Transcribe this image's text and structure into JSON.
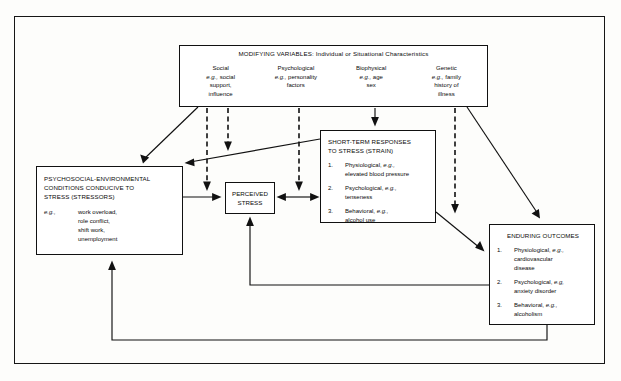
{
  "diagram": {
    "type": "flow-model",
    "modifying": {
      "header": "MODIFYING VARIABLES:  Individual or Situational Characteristics",
      "columns": [
        {
          "name": "Social",
          "eg_prefix": "e.g.,",
          "eg_text": "social",
          "lines": [
            "support,",
            "influence"
          ]
        },
        {
          "name": "Psychological",
          "eg_prefix": "e.g.,",
          "eg_text": "personality",
          "lines": [
            "factors"
          ]
        },
        {
          "name": "Biophysical",
          "eg_prefix": "e.g.,",
          "eg_text": "age",
          "lines": [
            "sex"
          ]
        },
        {
          "name": "Genetic",
          "eg_prefix": "e.g.,",
          "eg_text": "family",
          "lines": [
            "history of",
            "illness"
          ]
        }
      ]
    },
    "stressors": {
      "title_lines": [
        "PSYCHOSOCIAL-ENVIRONMENTAL",
        "CONDITIONS CONDUCIVE TO",
        "STRESS (STRESSORS)"
      ],
      "eg_label": "e.g.,",
      "examples": [
        "work overload,",
        "role conflict,",
        "shift work,",
        "unemployment"
      ]
    },
    "perceived": {
      "line1": "PERCEIVED",
      "line2": "STRESS"
    },
    "shortterm": {
      "title_lines": [
        "SHORT-TERM RESPONSES",
        "TO STRESS (STRAIN)"
      ],
      "items": [
        {
          "num": "1.",
          "head": "Physiological,",
          "ital": "e.g.,",
          "detail": "elevated blood pressure"
        },
        {
          "num": "2.",
          "head": "Psychological,",
          "ital": "e.g.,",
          "detail": "tenseness"
        },
        {
          "num": "3.",
          "head": "Behavioral,",
          "ital": "e.g.,",
          "detail": "alcohol use"
        }
      ]
    },
    "enduring": {
      "title": "ENDURING OUTCOMES",
      "items": [
        {
          "num": "1.",
          "head": "Physiological,",
          "ital": "e.g.,",
          "detail": "cardiovascular",
          "detail2": "disease"
        },
        {
          "num": "2.",
          "head": "Psychological,",
          "ital": "e.g,",
          "detail": "anxiety disorder",
          "detail2": ""
        },
        {
          "num": "3.",
          "head": "Behavioral,",
          "ital": "e.g.,",
          "detail": "alcoholism",
          "detail2": ""
        }
      ]
    },
    "colors": {
      "ink": "#111111",
      "paper": "#fdfdfb"
    }
  }
}
